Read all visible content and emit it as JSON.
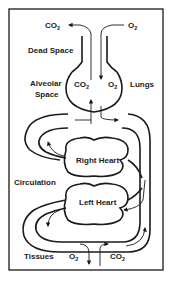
{
  "diagram": {
    "labels": {
      "co2_top": "CO",
      "co2_top_sub": "2",
      "o2_top": "O",
      "o2_top_sub": "2",
      "dead_space": "Dead Space",
      "alveolar_space_1": "Alveolar",
      "alveolar_space_2": "Space",
      "alveolar_co2": "CO",
      "alveolar_co2_sub": "2",
      "alveolar_o2": "O",
      "alveolar_o2_sub": "2",
      "lungs": "Lungs",
      "right_heart": "Right Heart",
      "circulation": "Circulation",
      "left_heart": "Left Heart",
      "tissues": "Tissues",
      "tissue_o2": "O",
      "tissue_o2_sub": "2",
      "tissue_co2": "CO",
      "tissue_co2_sub": "2"
    },
    "flows": [
      {
        "from": "alveolar space",
        "to": "atmosphere",
        "gas": "CO2",
        "direction": "out"
      },
      {
        "from": "atmosphere",
        "to": "alveolar space",
        "gas": "O2",
        "direction": "in"
      },
      {
        "from": "blood",
        "to": "tissues",
        "gas": "O2",
        "direction": "down"
      },
      {
        "from": "tissues",
        "to": "blood",
        "gas": "CO2",
        "direction": "up"
      }
    ],
    "colors": {
      "ink": "#1a1a1a",
      "background": "#ffffff"
    }
  }
}
